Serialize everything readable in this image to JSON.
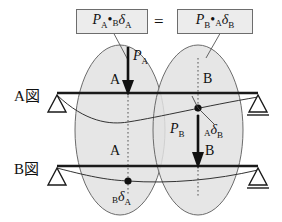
{
  "diagram": {
    "title_equation": {
      "left_box": {
        "full": "PA·BδA",
        "p_symbol": "P",
        "p_subscript": "A",
        "dot": "•",
        "delta_presub": "B",
        "delta_symbol": "δ",
        "delta_subscript": "A"
      },
      "equals": "=",
      "right_box": {
        "full": "PB·AδB",
        "p_symbol": "P",
        "p_subscript": "B",
        "dot": "•",
        "delta_presub": "A",
        "delta_symbol": "δ",
        "delta_subscript": "B"
      }
    },
    "figures": [
      {
        "name": "figure-a",
        "label": "A図",
        "load": {
          "symbol": "P",
          "subscript": "A",
          "at_node": "A",
          "direction": "down"
        },
        "nodes": [
          "A",
          "B"
        ],
        "supports": [
          "pin",
          "roller"
        ]
      },
      {
        "name": "figure-b",
        "label": "B図",
        "load": {
          "symbol": "P",
          "subscript": "B",
          "at_node": "B",
          "direction": "down"
        },
        "nodes": [
          "A",
          "B"
        ],
        "supports": [
          "pin",
          "roller"
        ]
      }
    ],
    "deflection_labels": [
      {
        "name": "delta-a-b-upper",
        "presub": "A",
        "symbol": "δ",
        "subscript": "B",
        "describes": "deflection at B in figure A"
      },
      {
        "name": "delta-b-a-lower",
        "presub": "B",
        "symbol": "δ",
        "subscript": "A",
        "describes": "deflection at A in figure B"
      }
    ],
    "node_labels": {
      "fig_a_left": "A",
      "fig_a_right": "B",
      "fig_b_left": "A",
      "fig_b_right": "B"
    },
    "colors": {
      "ellipse_fill": "#e2e2e2",
      "ellipse_stroke": "#6b6b6b",
      "beam": "#1a1a1a",
      "box_fill": "#ececec",
      "box_stroke": "#6d6d6d",
      "ink": "#111111"
    }
  }
}
